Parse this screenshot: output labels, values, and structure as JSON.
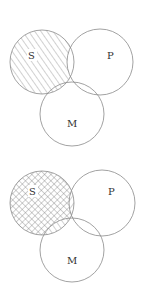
{
  "diagrams": [
    {
      "id": "top",
      "labels": {
        "s": "S",
        "p": "P",
        "m": "M"
      },
      "shading": {
        "s_only": "hatch-forward",
        "s_and_m_not_p": "hatch-forward",
        "s_and_p_not_m": "none",
        "s_and_p_and_m": "none"
      }
    },
    {
      "id": "bottom",
      "labels": {
        "s": "S",
        "p": "P",
        "m": "M"
      },
      "shading": {
        "s_only": "crosshatch",
        "s_and_m_not_p": "hatch-forward",
        "s_and_p_not_m": "hatch-backward",
        "s_and_p_and_m": "none"
      }
    }
  ],
  "colors": {
    "stroke": "#8a8a8a",
    "hatch": "#7a7a7a",
    "text": "#333333"
  }
}
